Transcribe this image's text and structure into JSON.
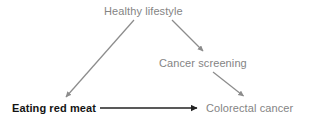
{
  "diagram": {
    "type": "causal-pathway-diagram",
    "background_color": "#ffffff",
    "width": 313,
    "height": 124,
    "nodes": [
      {
        "id": "healthy-lifestyle",
        "label": "Healthy lifestyle",
        "color": "#848484",
        "bold": false,
        "x": 104,
        "y": 5
      },
      {
        "id": "cancer-screening",
        "label": "Cancer screening",
        "color": "#848484",
        "bold": false,
        "x": 159,
        "y": 57
      },
      {
        "id": "eating-red-meat",
        "label": "Eating red meat",
        "color": "#141414",
        "bold": true,
        "x": 12,
        "y": 102
      },
      {
        "id": "colorectal-cancer",
        "label": "Colorectal cancer",
        "color": "#848484",
        "bold": false,
        "x": 206,
        "y": 102
      }
    ],
    "edges": [
      {
        "id": "healthy-lifestyle-to-eating-red-meat",
        "from": "healthy-lifestyle",
        "to": "eating-red-meat",
        "color": "#8c8c8c",
        "x1": 134,
        "y1": 20,
        "x2": 64,
        "y2": 99
      },
      {
        "id": "healthy-lifestyle-to-cancer-screening",
        "from": "healthy-lifestyle",
        "to": "cancer-screening",
        "color": "#8c8c8c",
        "x1": 172,
        "y1": 20,
        "x2": 205,
        "y2": 53
      },
      {
        "id": "cancer-screening-to-colorectal-cancer",
        "from": "cancer-screening",
        "to": "colorectal-cancer",
        "color": "#8c8c8c",
        "x1": 213,
        "y1": 72,
        "x2": 245,
        "y2": 98
      },
      {
        "id": "eating-red-meat-to-colorectal-cancer",
        "from": "eating-red-meat",
        "to": "colorectal-cancer",
        "color": "#222222",
        "x1": 100,
        "y1": 108,
        "x2": 201,
        "y2": 108
      }
    ]
  }
}
